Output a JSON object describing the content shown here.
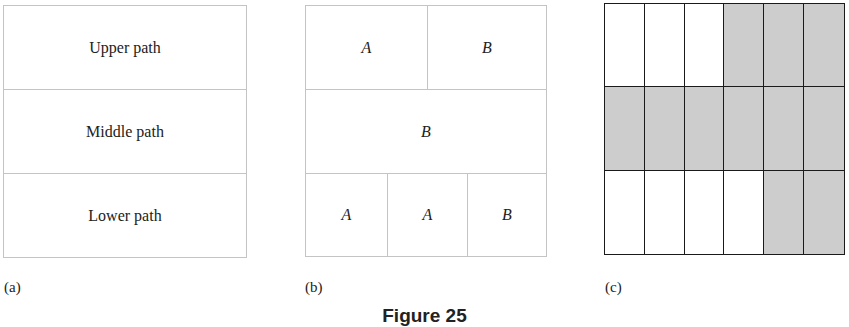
{
  "figure": {
    "caption": "Figure 25",
    "colors": {
      "shaded": "#cdcdcd",
      "grid_line": "#1a1a1a",
      "light_line": "#c4c4c4"
    }
  },
  "panel_a": {
    "label": "(a)",
    "rows": [
      "Upper path",
      "Middle path",
      "Lower path"
    ]
  },
  "panel_b": {
    "label": "(b)",
    "top_row": [
      "A",
      "B"
    ],
    "middle_row": [
      "B"
    ],
    "bottom_row": [
      "A",
      "A",
      "B"
    ]
  },
  "panel_c": {
    "label": "(c)",
    "rows": 3,
    "cols": 6,
    "shading": [
      [
        0,
        0,
        0,
        1,
        1,
        1
      ],
      [
        1,
        1,
        1,
        1,
        1,
        1
      ],
      [
        0,
        0,
        0,
        0,
        1,
        1
      ]
    ]
  }
}
